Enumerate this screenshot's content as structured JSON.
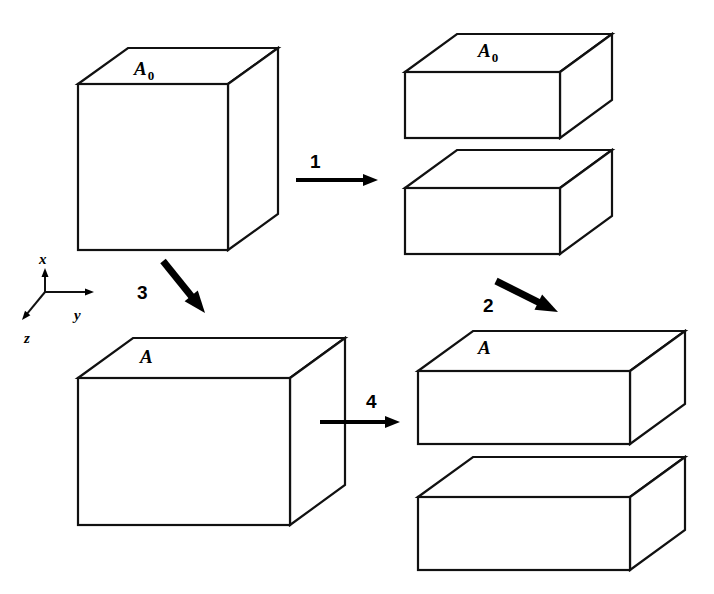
{
  "figure": {
    "background_color": "#ffffff",
    "line_color": "#111111",
    "arrow_color": "#000000"
  },
  "axes": {
    "name": "coordinate-axes",
    "origin": {
      "x": 45,
      "y": 292
    },
    "x_axis": {
      "label": "x",
      "label_x": 39,
      "label_y": 264,
      "tip_x": 45,
      "tip_y": 268
    },
    "y_axis": {
      "label": "y",
      "label_x": 74,
      "label_y": 320,
      "tip_x": 94,
      "tip_y": 292
    },
    "z_axis": {
      "label": "z",
      "label_x": 24,
      "label_y": 343,
      "tip_x": 22,
      "tip_y": 320
    }
  },
  "shapes": [
    {
      "id": "cube-a0",
      "name": "cube-initial-a0",
      "label": "A",
      "subscript": "0",
      "label_x": 134,
      "label_y": 75,
      "description": "Initial undeformed cube with top face A0",
      "front": {
        "x": 78,
        "y": 84,
        "w": 150,
        "h": 166
      },
      "depth_dx": 50,
      "depth_dy": -36
    },
    {
      "id": "slab-a0-upper",
      "name": "slab-split-upper-a0",
      "label": "A",
      "subscript": "0",
      "label_x": 478,
      "label_y": 57,
      "description": "Upper half slab after split, top face A0",
      "front": {
        "x": 405,
        "y": 72,
        "w": 155,
        "h": 66
      },
      "depth_dx": 52,
      "depth_dy": -38
    },
    {
      "id": "slab-a0-lower",
      "name": "slab-split-lower-a0",
      "label": "",
      "subscript": "",
      "label_x": 0,
      "label_y": 0,
      "description": "Lower half slab after split",
      "front": {
        "x": 405,
        "y": 188,
        "w": 155,
        "h": 66
      },
      "depth_dx": 52,
      "depth_dy": -38
    },
    {
      "id": "box-a",
      "name": "box-deformed-a",
      "label": "A",
      "subscript": "",
      "label_x": 140,
      "label_y": 363,
      "description": "Deformed box with enlarged top face A",
      "front": {
        "x": 78,
        "y": 378,
        "w": 212,
        "h": 147
      },
      "depth_dx": 55,
      "depth_dy": -40
    },
    {
      "id": "slab-a-upper",
      "name": "slab-deformed-upper-a",
      "label": "A",
      "subscript": "",
      "label_x": 478,
      "label_y": 354,
      "description": "Deformed upper slab, top face A",
      "front": {
        "x": 418,
        "y": 371,
        "w": 212,
        "h": 73
      },
      "depth_dx": 55,
      "depth_dy": -40
    },
    {
      "id": "slab-a-lower",
      "name": "slab-deformed-lower-a",
      "label": "",
      "subscript": "",
      "label_x": 0,
      "label_y": 0,
      "description": "Deformed lower slab",
      "front": {
        "x": 418,
        "y": 497,
        "w": 212,
        "h": 73
      },
      "depth_dx": 55,
      "depth_dy": -40
    }
  ],
  "arrows": [
    {
      "id": "arrow-1",
      "name": "arrow-step-1",
      "label": "1",
      "label_x": 310,
      "label_y": 168,
      "style": "thin",
      "x1": 296,
      "y1": 180,
      "x2": 378,
      "y2": 180,
      "description": "Step 1: split undeformed cube into two slabs"
    },
    {
      "id": "arrow-2",
      "name": "arrow-step-2",
      "label": "2",
      "label_x": 483,
      "label_y": 312,
      "style": "thick",
      "x1": 496,
      "y1": 281,
      "x2": 558,
      "y2": 312,
      "description": "Step 2: deform the split slabs"
    },
    {
      "id": "arrow-3",
      "name": "arrow-step-3",
      "label": "3",
      "label_x": 137,
      "label_y": 299,
      "style": "thick",
      "x1": 163,
      "y1": 261,
      "x2": 205,
      "y2": 313,
      "description": "Step 3: deform the whole cube"
    },
    {
      "id": "arrow-4",
      "name": "arrow-step-4",
      "label": "4",
      "label_x": 366,
      "label_y": 408,
      "style": "thin",
      "x1": 320,
      "y1": 422,
      "x2": 400,
      "y2": 422,
      "description": "Step 4: split the deformed box into two slabs"
    }
  ]
}
